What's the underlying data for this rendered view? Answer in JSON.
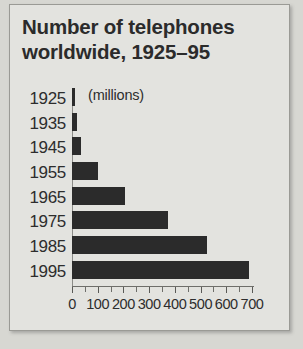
{
  "chart_data": {
    "type": "bar",
    "orientation": "horizontal",
    "title": "Number of telephones worldwide, 1925–95",
    "title_line1": "Number of telephones",
    "title_line2": "worldwide, 1925–95",
    "units_label": "(millions)",
    "xlabel": "",
    "ylabel": "",
    "categories": [
      "1925",
      "1935",
      "1945",
      "1955",
      "1965",
      "1975",
      "1985",
      "1995"
    ],
    "values": [
      10,
      20,
      35,
      100,
      205,
      375,
      525,
      690
    ],
    "xlim": [
      0,
      700
    ],
    "xticks": [
      0,
      100,
      200,
      300,
      400,
      500,
      600,
      700
    ],
    "xtick_labels": [
      "0",
      "100",
      "200",
      "300",
      "400",
      "500",
      "600",
      "700"
    ],
    "minor_tick_step": 50,
    "grid": false,
    "legend": null,
    "bar_color": "#2b2b2b",
    "background_color": "#e3e3df"
  },
  "figure": {
    "panel_background": "#e3e3df",
    "outer_background": "#d7d7d2",
    "border_color": "#9a9a95"
  }
}
